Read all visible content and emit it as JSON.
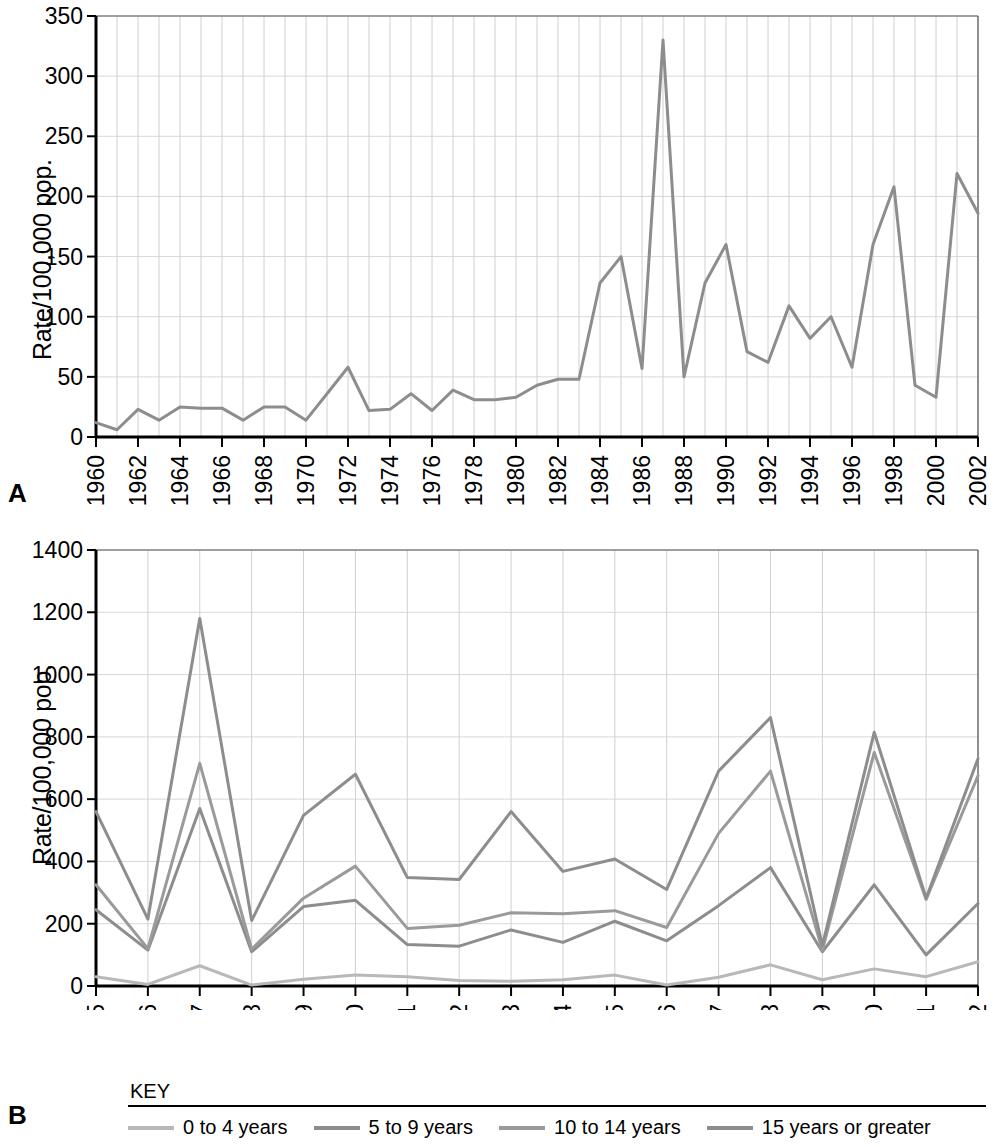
{
  "figure": {
    "panels": [
      {
        "letter": "A"
      },
      {
        "letter": "B"
      }
    ]
  },
  "legend": {
    "title": "KEY",
    "items": [
      {
        "label": "0 to 4 years",
        "color": "#b8b8b8"
      },
      {
        "label": "5 to 9 years",
        "color": "#8d8d8d"
      },
      {
        "label": "10 to 14 years",
        "color": "#9a9a9a"
      },
      {
        "label": "15 years or greater",
        "color": "#8d8d8d"
      }
    ]
  },
  "chart_data": [
    {
      "type": "line",
      "panel": "A",
      "title": "",
      "xlabel": "",
      "ylabel": "Rate/100,000 pop.",
      "ylim": [
        0,
        350
      ],
      "yticks": [
        0,
        50,
        100,
        150,
        200,
        250,
        300,
        350
      ],
      "xlim": [
        1960,
        2002
      ],
      "xticks": [
        1960,
        1962,
        1964,
        1966,
        1968,
        1970,
        1972,
        1974,
        1976,
        1978,
        1980,
        1982,
        1984,
        1986,
        1988,
        1990,
        1992,
        1994,
        1996,
        1998,
        2000,
        2002
      ],
      "grid": true,
      "legend_position": "none",
      "x": [
        1960,
        1961,
        1962,
        1963,
        1964,
        1965,
        1966,
        1967,
        1968,
        1969,
        1970,
        1971,
        1972,
        1973,
        1974,
        1975,
        1976,
        1977,
        1978,
        1979,
        1980,
        1981,
        1982,
        1983,
        1984,
        1985,
        1986,
        1987,
        1988,
        1989,
        1990,
        1991,
        1992,
        1993,
        1994,
        1995,
        1996,
        1997,
        1998,
        1999,
        2000,
        2001,
        2002
      ],
      "series": [
        {
          "name": "All ages",
          "color": "#8d8d8d",
          "values": [
            12,
            6,
            23,
            14,
            25,
            24,
            24,
            14,
            25,
            25,
            14,
            36,
            58,
            22,
            23,
            36,
            22,
            39,
            31,
            31,
            33,
            43,
            48,
            48,
            128,
            150,
            57,
            330,
            50,
            128,
            160,
            71,
            62,
            109,
            82,
            100,
            58,
            160,
            208,
            43,
            33,
            219,
            186
          ]
        }
      ]
    },
    {
      "type": "line",
      "panel": "B",
      "title": "",
      "xlabel": "",
      "ylabel": "Rate/100,000 pop.",
      "ylim": [
        0,
        1400
      ],
      "yticks": [
        0,
        200,
        400,
        600,
        800,
        1000,
        1200,
        1400
      ],
      "xlim": [
        1985,
        2002
      ],
      "xticks": [
        1985,
        1986,
        1987,
        1988,
        1989,
        1990,
        1991,
        1992,
        1993,
        1994,
        1995,
        1996,
        1997,
        1998,
        1999,
        2000,
        2001,
        2002
      ],
      "grid": true,
      "legend_position": "bottom",
      "x": [
        1985,
        1986,
        1987,
        1988,
        1989,
        1990,
        1991,
        1992,
        1993,
        1994,
        1995,
        1996,
        1997,
        1998,
        1999,
        2000,
        2001,
        2002
      ],
      "series": [
        {
          "name": "0 to 4 years",
          "color": "#b8b8b8",
          "values": [
            30,
            5,
            65,
            3,
            22,
            35,
            30,
            18,
            15,
            20,
            35,
            3,
            28,
            68,
            20,
            55,
            30,
            78
          ]
        },
        {
          "name": "5 to 9 years",
          "color": "#8d8d8d",
          "values": [
            245,
            115,
            570,
            110,
            255,
            275,
            133,
            128,
            180,
            140,
            208,
            145,
            258,
            380,
            110,
            325,
            100,
            265
          ]
        },
        {
          "name": "10 to 14 years",
          "color": "#9a9a9a",
          "values": [
            325,
            120,
            715,
            118,
            282,
            385,
            185,
            195,
            235,
            232,
            242,
            188,
            490,
            690,
            115,
            750,
            278,
            675
          ]
        },
        {
          "name": "15 years or greater",
          "color": "#8d8d8d",
          "values": [
            560,
            215,
            1180,
            210,
            548,
            680,
            348,
            342,
            560,
            368,
            408,
            310,
            690,
            862,
            130,
            815,
            282,
            730
          ]
        }
      ]
    }
  ]
}
